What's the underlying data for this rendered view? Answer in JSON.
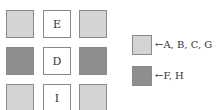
{
  "colors": {
    "light": "#d4d4d4",
    "dark": "#8e8e8e",
    "white": "#ffffff",
    "border": "#8a8a8a"
  },
  "grid": {
    "rows": [
      [
        {
          "fill": "light",
          "label": ""
        },
        {
          "fill": "white",
          "label": "E"
        },
        {
          "fill": "light",
          "label": ""
        }
      ],
      [
        {
          "fill": "dark",
          "label": ""
        },
        {
          "fill": "white",
          "label": "D"
        },
        {
          "fill": "dark",
          "label": ""
        }
      ],
      [
        {
          "fill": "light",
          "label": ""
        },
        {
          "fill": "white",
          "label": "I"
        },
        {
          "fill": "light",
          "label": ""
        }
      ]
    ]
  },
  "legend": [
    {
      "fill": "light",
      "text": "←A, B, C, G"
    },
    {
      "fill": "dark",
      "text": "←F, H"
    }
  ]
}
